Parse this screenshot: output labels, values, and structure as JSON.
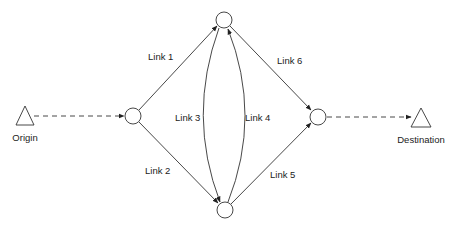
{
  "colors": {
    "stroke": "#333333",
    "text": "#222222",
    "background": "#ffffff"
  },
  "terminals": {
    "origin": {
      "label": "Origin",
      "shape": "triangle"
    },
    "destination": {
      "label": "Destination",
      "shape": "triangle"
    }
  },
  "nodes": [
    {
      "id": "left",
      "shape": "circle"
    },
    {
      "id": "top",
      "shape": "circle"
    },
    {
      "id": "bottom",
      "shape": "circle"
    },
    {
      "id": "right",
      "shape": "circle"
    }
  ],
  "links": [
    {
      "id": 1,
      "label": "Link 1",
      "from": "left",
      "to": "top"
    },
    {
      "id": 2,
      "label": "Link 2",
      "from": "left",
      "to": "bottom"
    },
    {
      "id": 3,
      "label": "Link 3",
      "from": "top",
      "to": "bottom",
      "curved": true
    },
    {
      "id": 4,
      "label": "Link 4",
      "from": "bottom",
      "to": "top",
      "curved": true
    },
    {
      "id": 5,
      "label": "Link 5",
      "from": "bottom",
      "to": "right"
    },
    {
      "id": 6,
      "label": "Link 6",
      "from": "top",
      "to": "right"
    }
  ],
  "connectors": [
    {
      "from": "origin",
      "to": "left",
      "style": "dashed"
    },
    {
      "from": "right",
      "to": "destination",
      "style": "dashed"
    }
  ]
}
